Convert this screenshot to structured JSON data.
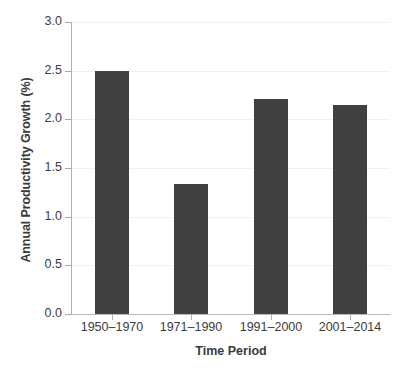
{
  "chart_data": {
    "type": "bar",
    "title": "",
    "xlabel": "Time Period",
    "ylabel": "Annual Productivity Growth (%)",
    "categories": [
      "1950–1970",
      "1971–1990",
      "1991–2000",
      "2001–2014"
    ],
    "values": [
      2.5,
      1.34,
      2.21,
      2.15
    ],
    "ylim": [
      0.0,
      3.0
    ],
    "ytick_labels": [
      "0.0",
      "0.5",
      "1.0",
      "1.5",
      "2.0",
      "2.5",
      "3.0"
    ],
    "ytick_values": [
      0.0,
      0.5,
      1.0,
      1.5,
      2.0,
      2.5,
      3.0
    ],
    "grid": "horizontal",
    "legend": "none",
    "bar_color": "#404040",
    "grid_color": "#f0f0f0",
    "axis_color": "#b0b0b0"
  }
}
